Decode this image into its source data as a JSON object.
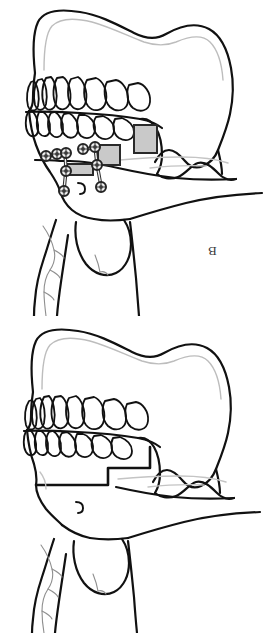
{
  "figure": {
    "background_color": "#ffffff",
    "width": 268,
    "height": 633,
    "line_color": "#111111",
    "faint_line_color": "#b9b9b9",
    "graft_fill_color": "#c9c9c9",
    "graft_stroke_color": "#2a2a2a",
    "hardware_fill_color": "#ededed",
    "hardware_stroke_color": "#2b2b2b",
    "label_color": "#3a3a3a"
  },
  "panels": [
    {
      "id": "panel-b",
      "label": "B",
      "label_rotated_180": true,
      "position": "top",
      "caption_meaning": "Post-operative: step osteotomy with interpositional bone grafts and miniplate fixation",
      "features": [
        "cranium-outline",
        "maxilla",
        "upper-tooth-row",
        "lower-tooth-row",
        "mandible-body",
        "mandibular-ramus",
        "condyle",
        "coronoid-process",
        "sigmoid-notch",
        "mental-region",
        "hyoid-bone",
        "cervical-vertebra",
        "soft-tissue-neck-line",
        "bone-graft-blocks",
        "fixation-miniplates",
        "bone-screws"
      ],
      "graft_blocks": [
        {
          "name": "graft-block-posterior",
          "x": 134,
          "y": 125,
          "w": 23,
          "h": 28
        },
        {
          "name": "graft-block-middle",
          "x": 98,
          "y": 145,
          "w": 22,
          "h": 20
        },
        {
          "name": "graft-block-anterior",
          "x": 67,
          "y": 164,
          "w": 26,
          "h": 11
        }
      ],
      "plates": [
        {
          "name": "miniplate-anterior",
          "screw_count": 4
        },
        {
          "name": "miniplate-posterior",
          "screw_count": 4
        }
      ],
      "screw_total": 8
    },
    {
      "id": "panel-a",
      "label": "A",
      "label_rotated_180": true,
      "position": "bottom",
      "caption_meaning": "Pre-operative / planned step osteotomy outline of the mandible",
      "features": [
        "cranium-outline",
        "maxilla",
        "upper-tooth-row",
        "lower-tooth-row",
        "mandible-body",
        "mandibular-ramus",
        "condyle",
        "coronoid-process",
        "sigmoid-notch",
        "step-osteotomy-cut",
        "mental-region",
        "hyoid-bone",
        "cervical-vertebra",
        "soft-tissue-neck-line"
      ],
      "graft_blocks": [],
      "plates": [],
      "screw_total": 0
    }
  ]
}
